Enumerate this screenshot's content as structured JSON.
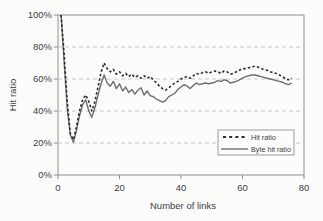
{
  "chart_data": {
    "type": "line",
    "title": "",
    "xlabel": "Number of links",
    "ylabel": "Hit ratio",
    "xlim": [
      0,
      80
    ],
    "ylim": [
      0,
      100
    ],
    "x_ticks": [
      0,
      20,
      40,
      60,
      80
    ],
    "y_ticks": [
      0,
      20,
      40,
      60,
      80,
      100
    ],
    "y_tick_suffix": "%",
    "grid": "horizontal dashed gridlines at 20/40/60/80%",
    "legend_position": "inside bottom-right",
    "legend": [
      {
        "label": "Hit ratio",
        "style": "dashed",
        "color": "#2e2e2e"
      },
      {
        "label": "Byte hit ratio",
        "style": "solid",
        "color": "#6d6d6d"
      }
    ],
    "x": [
      1,
      2,
      3,
      4,
      5,
      6,
      7,
      8,
      9,
      10,
      11,
      12,
      13,
      14,
      15,
      16,
      17,
      18,
      19,
      20,
      21,
      22,
      23,
      24,
      25,
      26,
      27,
      28,
      29,
      30,
      31,
      32,
      33,
      34,
      35,
      36,
      37,
      38,
      39,
      40,
      41,
      42,
      43,
      44,
      45,
      46,
      47,
      48,
      49,
      50,
      51,
      52,
      53,
      54,
      55,
      56,
      57,
      58,
      59,
      60,
      61,
      62,
      63,
      64,
      65,
      66,
      67,
      68,
      69,
      70,
      71,
      72,
      73,
      74,
      75,
      76
    ],
    "series": [
      {
        "name": "Hit ratio",
        "style": "dashed",
        "values": [
          100,
          75,
          46,
          26,
          22,
          30,
          40,
          47,
          50,
          46,
          40,
          46,
          55,
          64,
          70,
          66.5,
          64.5,
          66,
          63,
          64.5,
          62,
          63.5,
          61.5,
          63,
          61,
          62,
          60.5,
          62,
          60.5,
          61.5,
          59.5,
          57.5,
          55.5,
          54,
          53,
          54.5,
          56,
          57.5,
          58.5,
          60,
          61,
          61.5,
          60.5,
          62,
          63.5,
          63,
          64,
          64.5,
          63.5,
          64.5,
          65,
          64.5,
          63.5,
          65,
          64.5,
          63,
          63.5,
          64.5,
          65.5,
          66.5,
          66.5,
          67,
          67.5,
          68,
          67.5,
          66.5,
          66,
          65.5,
          64.5,
          64,
          63.5,
          62.5,
          61.5,
          60,
          59.5,
          60.5
        ]
      },
      {
        "name": "Byte hit ratio",
        "style": "solid",
        "values": [
          100,
          70,
          42,
          25,
          20.5,
          28,
          37,
          44,
          47,
          40,
          36,
          42,
          50,
          57,
          62.5,
          57.5,
          55.5,
          58.5,
          54,
          57,
          52.5,
          55,
          51.5,
          53.5,
          50.5,
          53,
          54.5,
          50,
          52.5,
          49.5,
          49,
          47.5,
          46.5,
          45.5,
          46.5,
          49,
          50,
          51,
          53.5,
          55,
          56.5,
          55.5,
          54,
          56,
          57.5,
          56.5,
          57,
          57.5,
          57,
          57.5,
          58,
          59,
          58.5,
          59.5,
          59,
          57.5,
          58,
          58.5,
          59.5,
          60.5,
          61.5,
          62,
          62.5,
          62.5,
          62,
          61.5,
          61,
          60.5,
          60,
          59.5,
          59,
          58.5,
          58,
          57,
          56.5,
          57.5
        ]
      }
    ]
  },
  "colors": {
    "background": "#fcfcfb",
    "frame": "#8f8f8f",
    "gridline": "#c6c6c6",
    "text": "#3d3d3d",
    "hit_ratio_line": "#2e2e2e",
    "byte_hit_ratio_line": "#6d6d6d"
  }
}
